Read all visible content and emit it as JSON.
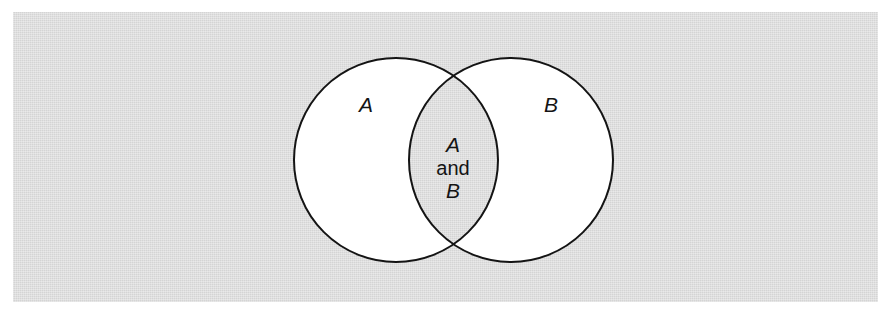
{
  "figure": {
    "kind": "venn-diagram",
    "panel": {
      "background_color": "#d4d4d4",
      "page_color": "#ffffff",
      "x": 13,
      "y": 12,
      "width": 865,
      "height": 290
    },
    "stroke_color": "#141414",
    "stroke_width": 2,
    "circle_fill_color": "#ffffff",
    "intersection_fill_color": "#d4d4d4",
    "sets": [
      {
        "id": "set-a",
        "label": "A",
        "label_style": "italic",
        "center_x": 396,
        "center_y": 160,
        "radius": 102,
        "label_x": 366,
        "label_y": 112
      },
      {
        "id": "set-b",
        "label": "B",
        "label_style": "italic",
        "center_x": 511,
        "center_y": 160,
        "radius": 102,
        "label_x": 551,
        "label_y": 112
      }
    ],
    "intersection": {
      "id": "intersection-a-and-b",
      "center_x": 453,
      "lines": [
        {
          "text": "A",
          "style": "italic",
          "y": 152
        },
        {
          "text": "and",
          "style": "normal",
          "y": 175
        },
        {
          "text": "B",
          "style": "italic",
          "y": 198
        }
      ]
    }
  }
}
